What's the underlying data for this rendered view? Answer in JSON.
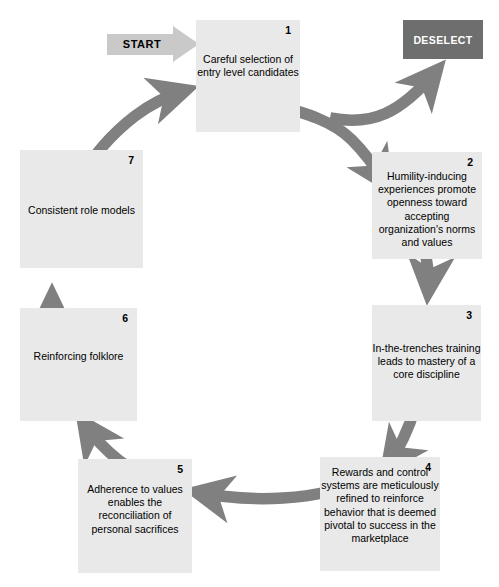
{
  "diagram": {
    "start_label": "START",
    "terminal": {
      "label": "DESELECT",
      "fill": "#6e6e6e",
      "text_color": "#ffffff"
    },
    "colors": {
      "box_fill": "#e9e9e9",
      "ring": "#808080",
      "start_arrow": "#c9c9c9",
      "text": "#000000",
      "background": "#ffffff"
    },
    "stages": [
      {
        "number": "1",
        "text": "Careful selection of entry level candidates"
      },
      {
        "number": "2",
        "text": "Humility-inducing experiences promote openness toward accepting organization's norms and values"
      },
      {
        "number": "3",
        "text": "In-the-trenches training leads to mastery of a core discipline"
      },
      {
        "number": "4",
        "text": "Rewards and control systems are meticulously refined to reinforce behavior that is deemed pivotal to success in the marketplace"
      },
      {
        "number": "5",
        "text": "Adherence to values enables the reconciliation of personal sacrifices"
      },
      {
        "number": "6",
        "text": "Reinforcing folklore"
      },
      {
        "number": "7",
        "text": "Consistent role models"
      }
    ]
  }
}
